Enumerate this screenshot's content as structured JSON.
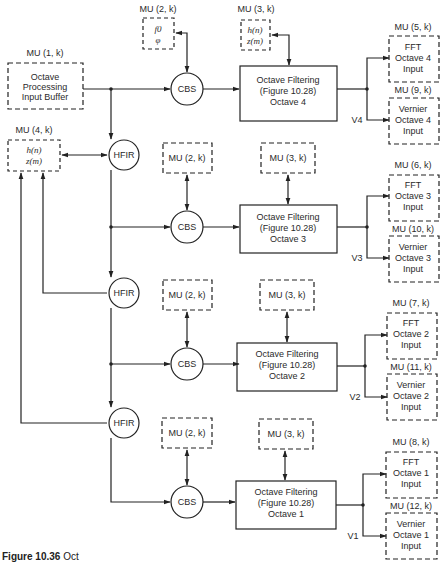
{
  "diagram": {
    "type": "block-diagram",
    "caption": {
      "number": "Figure 10.36",
      "text": "Oct"
    },
    "input_buffer": {
      "label": "MU (1, k)",
      "lines": [
        "Octave",
        "Processing",
        "Input Buffer"
      ]
    },
    "coef_memory_top": {
      "label": "MU (2, k)",
      "lines": [
        "f0",
        "φ"
      ]
    },
    "filter_memory_top": {
      "label": "MU (3, k)",
      "lines": [
        "h(n)",
        "z(m)"
      ]
    },
    "hfir_memory": {
      "label": "MU (4, k)",
      "lines": [
        "h(n)",
        "z(m)"
      ]
    },
    "cbs_label": "CBS",
    "hfir_label": "HFIR",
    "mu2_box_label": "MU (2, k)",
    "mu3_box_label": "MU (3, k)",
    "octaves": [
      {
        "filter": [
          "Octave Filtering",
          "(Figure 10.28)",
          "Octave 4"
        ],
        "fft": {
          "label": "MU (5, k)",
          "lines": [
            "FFT",
            "Octave 4",
            "Input"
          ]
        },
        "vernier": {
          "label": "MU (9, k)",
          "lines": [
            "Vernier",
            "Octave 4",
            "Input"
          ]
        },
        "v_label": "V4"
      },
      {
        "filter": [
          "Octave Filtering",
          "(Figure 10.28)",
          "Octave 3"
        ],
        "fft": {
          "label": "MU (6, k)",
          "lines": [
            "FFT",
            "Octave 3",
            "Input"
          ]
        },
        "vernier": {
          "label": "MU (10, k)",
          "lines": [
            "Vernier",
            "Octave 3",
            "Input"
          ]
        },
        "v_label": "V3"
      },
      {
        "filter": [
          "Octave Filtering",
          "(Figure 10.28)",
          "Octave 2"
        ],
        "fft": {
          "label": "MU (7, k)",
          "lines": [
            "FFT",
            "Octave 2",
            "Input"
          ]
        },
        "vernier": {
          "label": "MU (11, k)",
          "lines": [
            "Vernier",
            "Octave 2",
            "Input"
          ]
        },
        "v_label": "V2"
      },
      {
        "filter": [
          "Octave Filtering",
          "(Figure 10.28)",
          "Octave 1"
        ],
        "fft": {
          "label": "MU (8, k)",
          "lines": [
            "FFT",
            "Octave 1",
            "Input"
          ]
        },
        "vernier": {
          "label": "MU (12, k)",
          "lines": [
            "Vernier",
            "Octave 1",
            "Input"
          ]
        },
        "v_label": "V1"
      }
    ]
  }
}
